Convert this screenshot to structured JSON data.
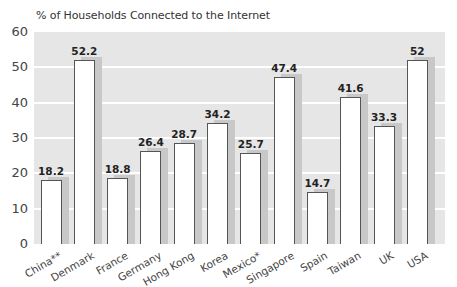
{
  "chart_data": {
    "type": "bar",
    "title": "% of Households Connected to the Internet",
    "xlabel": "",
    "ylabel": "",
    "ylim": [
      0,
      60
    ],
    "yticks": [
      0,
      10,
      20,
      30,
      40,
      50,
      60
    ],
    "grid": true,
    "categories": [
      "China**",
      "Denmark",
      "France",
      "Germany",
      "Hong Kong",
      "Korea",
      "Mexico*",
      "Singapore",
      "Spain",
      "Taiwan",
      "UK",
      "USA"
    ],
    "values": [
      18.2,
      52.2,
      18.8,
      26.4,
      28.7,
      34.2,
      25.7,
      47.4,
      14.7,
      41.6,
      33.3,
      52
    ],
    "value_labels": [
      "18.2",
      "52.2",
      "18.8",
      "26.4",
      "28.7",
      "34.2",
      "25.7",
      "47.4",
      "14.7",
      "41.6",
      "33.3",
      "52"
    ],
    "colors": {
      "bar_fill": "#ffffff",
      "bar_outline": "#555555",
      "shadow": "#c8c8c8",
      "plot_bg": "#e6e6e6",
      "gridline": "#ffffff"
    }
  }
}
